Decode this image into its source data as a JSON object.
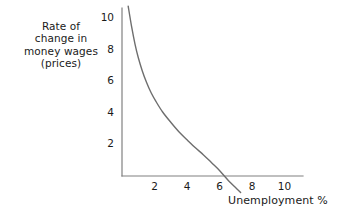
{
  "chart_data": {
    "type": "line",
    "title": "",
    "subtitle": "",
    "xlabel": "Unemployment %",
    "ylabel_lines": [
      "Rate of",
      "change in",
      "money wages",
      "(prices)"
    ],
    "ylabel": "Rate of change in money wages (prices)",
    "xticks": [
      2,
      4,
      6,
      8,
      10
    ],
    "yticks": [
      2,
      4,
      6,
      8,
      10
    ],
    "xtick_labels": [
      "2",
      "4",
      "6",
      "8",
      "10"
    ],
    "ytick_labels": [
      "2",
      "4",
      "6",
      "8",
      "10"
    ],
    "xlim": [
      0,
      11.3
    ],
    "ylim": [
      -1.1,
      10.9
    ],
    "grid": false,
    "legend": null,
    "legend_position": "none",
    "series": [
      {
        "name": "Phillips curve",
        "color": "#6e6e6e",
        "points": [
          {
            "x": 0.38,
            "y": 10.75
          },
          {
            "x": 0.6,
            "y": 9.4
          },
          {
            "x": 0.8,
            "y": 8.35
          },
          {
            "x": 1.0,
            "y": 7.5
          },
          {
            "x": 1.25,
            "y": 6.65
          },
          {
            "x": 1.5,
            "y": 5.95
          },
          {
            "x": 1.8,
            "y": 5.25
          },
          {
            "x": 2.1,
            "y": 4.7
          },
          {
            "x": 2.5,
            "y": 4.05
          },
          {
            "x": 3.0,
            "y": 3.4
          },
          {
            "x": 3.5,
            "y": 2.8
          },
          {
            "x": 4.0,
            "y": 2.3
          },
          {
            "x": 4.5,
            "y": 1.8
          },
          {
            "x": 5.0,
            "y": 1.35
          },
          {
            "x": 5.5,
            "y": 0.85
          },
          {
            "x": 6.0,
            "y": 0.35
          },
          {
            "x": 6.3,
            "y": 0.0
          },
          {
            "x": 6.6,
            "y": -0.35
          },
          {
            "x": 7.0,
            "y": -0.75
          },
          {
            "x": 7.3,
            "y": -1.05
          }
        ]
      }
    ],
    "annotations": [],
    "axis_color": "#808080",
    "curve_color": "#6e6e6e",
    "background": "#ffffff"
  },
  "axes": {
    "x_axis_name": "unemployment-axis",
    "y_axis_name": "wage-change-axis"
  }
}
